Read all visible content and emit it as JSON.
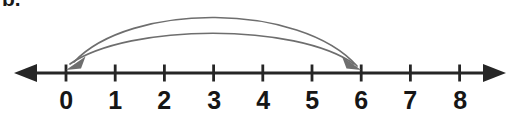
{
  "figure": {
    "problem_label": "b.",
    "type": "number-line-jump-diagram",
    "background_color": "#ffffff"
  },
  "number_line": {
    "axis_color": "#262626",
    "axis_y": 73,
    "axis_stroke_width": 3.2,
    "left_arrow_tip_x": 14,
    "right_arrow_tip_x": 506,
    "tick_height": 17,
    "tick_stroke_width": 2.8,
    "tick_spacing_px": 49.2,
    "origin_x": 66,
    "labels": [
      "0",
      "1",
      "2",
      "3",
      "4",
      "5",
      "6",
      "7",
      "8"
    ],
    "label_positions_x": [
      66,
      115.2,
      164.4,
      213.6,
      262.8,
      312,
      361.2,
      410.4,
      459.6
    ],
    "label_y": 88
  },
  "arcs": {
    "color": "#6e6e6e",
    "stroke_width": 1.6,
    "items": [
      {
        "name": "outer-arc",
        "from_value": 6,
        "to_value": 0,
        "from_x": 361.2,
        "to_x": 66,
        "apex_y": 21,
        "direction": "right-to-left",
        "arrowhead_at": "0"
      },
      {
        "name": "inner-arc",
        "from_value": 0,
        "to_value": 6,
        "from_x": 66,
        "to_x": 361.2,
        "apex_y": 41,
        "direction": "left-to-right",
        "arrowhead_at": "6"
      }
    ],
    "arrowhead_length": 14,
    "arrowhead_width": 9
  }
}
